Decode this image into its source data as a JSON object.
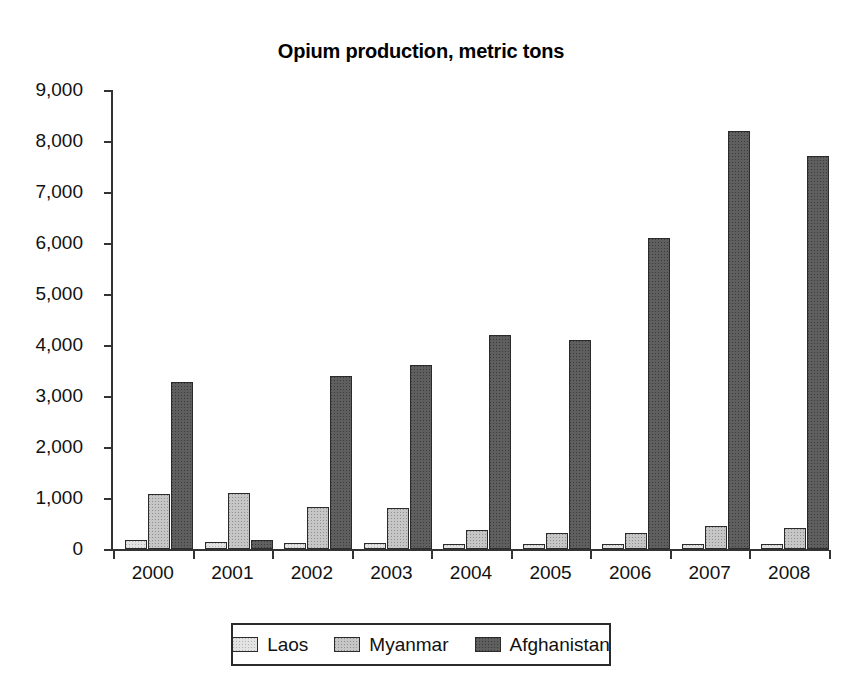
{
  "caption_fragment": "",
  "chart_data": {
    "type": "bar",
    "title": "Opium production, metric tons",
    "xlabel": "",
    "ylabel": "",
    "ylim": [
      0,
      9000
    ],
    "ytick_step": 1000,
    "grid": false,
    "legend_position": "bottom",
    "categories": [
      "2000",
      "2001",
      "2002",
      "2003",
      "2004",
      "2005",
      "2006",
      "2007",
      "2008"
    ],
    "ytick_labels": [
      "0",
      "1,000",
      "2,000",
      "3,000",
      "4,000",
      "5,000",
      "6,000",
      "7,000",
      "8,000",
      "9,000"
    ],
    "ytick_values": [
      0,
      1000,
      2000,
      3000,
      4000,
      5000,
      6000,
      7000,
      8000,
      9000
    ],
    "series": [
      {
        "name": "Laos",
        "color": "#e3e3e3",
        "values": [
          167,
          134,
          112,
          120,
          43,
          14,
          20,
          9,
          10
        ]
      },
      {
        "name": "Myanmar",
        "color": "#c6c6c6",
        "values": [
          1087,
          1097,
          828,
          810,
          370,
          312,
          315,
          460,
          410
        ]
      },
      {
        "name": "Afghanistan",
        "color": "#5f5f5f",
        "values": [
          3276,
          185,
          3400,
          3600,
          4200,
          4100,
          6100,
          8200,
          7700
        ]
      }
    ]
  }
}
